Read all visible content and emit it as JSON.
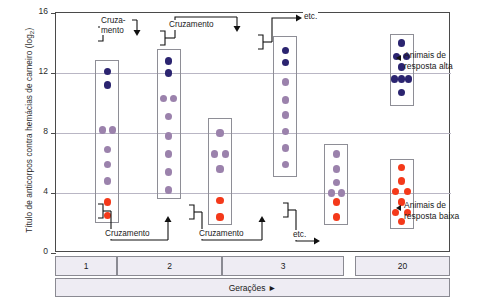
{
  "chart_data": {
    "type": "scatter",
    "title": "",
    "ylabel": "Título de anticorpos contra hemácias de carneiro (log2)",
    "xlabel": "Gerações",
    "ylim": [
      0,
      16
    ],
    "yticks": [
      0,
      4,
      8,
      12,
      16
    ],
    "grid": true,
    "legend_position": "right",
    "categories": [
      "1",
      "2",
      "3",
      "20"
    ],
    "series": [
      {
        "name": "Resposta alta (azul escuro)",
        "color": "#2b2470"
      },
      {
        "name": "Resposta intermediária (roxo)",
        "color": "#9b82ac"
      },
      {
        "name": "Resposta baixa (laranja)",
        "color": "#f4391a"
      }
    ],
    "groups": [
      {
        "id": "g1",
        "generation": "1",
        "box": {
          "x_center": 13.0,
          "y_top": 12.9,
          "y_bottom": 2.0
        },
        "points": [
          {
            "offset": 0,
            "value": 12.1,
            "color": "dark"
          },
          {
            "offset": 0,
            "value": 11.2,
            "color": "dark"
          },
          {
            "offset": -1,
            "value": 8.2,
            "color": "mid"
          },
          {
            "offset": 1,
            "value": 8.2,
            "color": "mid"
          },
          {
            "offset": 0,
            "value": 6.9,
            "color": "mid"
          },
          {
            "offset": 0,
            "value": 5.9,
            "color": "mid"
          },
          {
            "offset": 0,
            "value": 4.8,
            "color": "mid"
          },
          {
            "offset": 0,
            "value": 3.4,
            "color": "low"
          },
          {
            "offset": 0,
            "value": 2.5,
            "color": "low"
          }
        ]
      },
      {
        "id": "g2a",
        "generation": "2",
        "box": {
          "x_center": 28.5,
          "y_top": 13.6,
          "y_bottom": 3.6
        },
        "points": [
          {
            "offset": 0,
            "value": 12.8,
            "color": "dark"
          },
          {
            "offset": 0,
            "value": 12.0,
            "color": "dark"
          },
          {
            "offset": -1,
            "value": 10.3,
            "color": "mid"
          },
          {
            "offset": 1,
            "value": 10.3,
            "color": "mid"
          },
          {
            "offset": 0,
            "value": 9.1,
            "color": "mid"
          },
          {
            "offset": 0,
            "value": 7.8,
            "color": "mid"
          },
          {
            "offset": 0,
            "value": 6.6,
            "color": "mid"
          },
          {
            "offset": 0,
            "value": 5.4,
            "color": "mid"
          },
          {
            "offset": 0,
            "value": 4.2,
            "color": "mid"
          }
        ]
      },
      {
        "id": "g2b",
        "generation": "2",
        "box": {
          "x_center": 41.5,
          "y_top": 9.0,
          "y_bottom": 1.9
        },
        "points": [
          {
            "offset": 0,
            "value": 8.0,
            "color": "mid"
          },
          {
            "offset": -1,
            "value": 6.6,
            "color": "mid"
          },
          {
            "offset": 1,
            "value": 6.6,
            "color": "mid"
          },
          {
            "offset": 0,
            "value": 5.6,
            "color": "mid"
          },
          {
            "offset": 0,
            "value": 3.5,
            "color": "low"
          },
          {
            "offset": 0,
            "value": 2.4,
            "color": "low"
          }
        ]
      },
      {
        "id": "g3a",
        "generation": "3",
        "box": {
          "x_center": 58.0,
          "y_top": 14.5,
          "y_bottom": 5.1
        },
        "points": [
          {
            "offset": 0,
            "value": 13.5,
            "color": "dark"
          },
          {
            "offset": 0,
            "value": 12.7,
            "color": "dark"
          },
          {
            "offset": 0,
            "value": 11.4,
            "color": "mid"
          },
          {
            "offset": 0,
            "value": 10.2,
            "color": "mid"
          },
          {
            "offset": 0,
            "value": 9.2,
            "color": "mid"
          },
          {
            "offset": 0,
            "value": 8.1,
            "color": "mid"
          },
          {
            "offset": 0,
            "value": 7.0,
            "color": "mid"
          },
          {
            "offset": 0,
            "value": 5.9,
            "color": "mid"
          }
        ]
      },
      {
        "id": "g3b",
        "generation": "3",
        "box": {
          "x_center": 71.0,
          "y_top": 7.3,
          "y_bottom": 1.9
        },
        "points": [
          {
            "offset": 0,
            "value": 6.6,
            "color": "mid"
          },
          {
            "offset": 0,
            "value": 5.6,
            "color": "mid"
          },
          {
            "offset": 0,
            "value": 4.7,
            "color": "mid"
          },
          {
            "offset": -1,
            "value": 4.0,
            "color": "mid"
          },
          {
            "offset": 1,
            "value": 4.0,
            "color": "mid"
          },
          {
            "offset": 0,
            "value": 3.4,
            "color": "low"
          },
          {
            "offset": 0,
            "value": 2.4,
            "color": "low"
          }
        ]
      },
      {
        "id": "g20a",
        "generation": "20",
        "box": {
          "x_center": 87.5,
          "y_top": 14.6,
          "y_bottom": 9.8
        },
        "points": [
          {
            "offset": 0,
            "value": 14.0,
            "color": "dark"
          },
          {
            "offset": -1,
            "value": 13.1,
            "color": "dark"
          },
          {
            "offset": 1,
            "value": 13.1,
            "color": "dark"
          },
          {
            "offset": 0,
            "value": 12.4,
            "color": "dark"
          },
          {
            "offset": -1.4,
            "value": 11.6,
            "color": "dark"
          },
          {
            "offset": 0,
            "value": 11.6,
            "color": "dark"
          },
          {
            "offset": 1.4,
            "value": 11.6,
            "color": "dark"
          },
          {
            "offset": 0,
            "value": 10.7,
            "color": "dark"
          }
        ]
      },
      {
        "id": "g20b",
        "generation": "20",
        "box": {
          "x_center": 87.5,
          "y_top": 6.3,
          "y_bottom": 1.6
        },
        "points": [
          {
            "offset": 0,
            "value": 5.7,
            "color": "low"
          },
          {
            "offset": 0,
            "value": 4.8,
            "color": "low"
          },
          {
            "offset": -1.2,
            "value": 4.1,
            "color": "low"
          },
          {
            "offset": 1.1,
            "value": 4.1,
            "color": "low"
          },
          {
            "offset": 0,
            "value": 3.4,
            "color": "low"
          },
          {
            "offset": -1.2,
            "value": 2.7,
            "color": "low"
          },
          {
            "offset": 1.1,
            "value": 2.7,
            "color": "low"
          },
          {
            "offset": 0,
            "value": 2.1,
            "color": "low"
          }
        ]
      }
    ]
  },
  "axis": {
    "y_title_main": "Título de anticorpos contra hemácias de carneiro (log",
    "y_title_sub": "2",
    "y_title_end": ")",
    "tick_16": "16",
    "tick_12": "12",
    "tick_8": "8",
    "tick_4": "4",
    "tick_0": "0"
  },
  "annotations": {
    "cross_top_1_line1": "Cruza-",
    "cross_top_1_line2": "mento",
    "cross_top_2": "Cruzamento",
    "etc_top": "etc.",
    "cross_bottom_1": "Cruzamento",
    "cross_bottom_2": "Cruzamento",
    "etc_bottom": "etc."
  },
  "generations": {
    "label": "Gerações ►",
    "cells": [
      "1",
      "2",
      "3",
      "20"
    ]
  },
  "callouts": {
    "high_line1": "Animais de",
    "high_line2": "resposta alta",
    "low_line1": "Animais de",
    "low_line2": "resposta baixa"
  }
}
